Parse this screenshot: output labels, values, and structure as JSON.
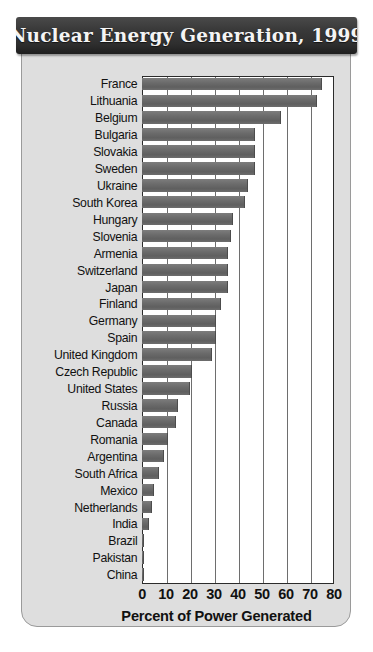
{
  "title": "Nuclear Energy Generation, 1999",
  "axis_label": "Percent of Power Generated",
  "colors": {
    "banner": "#2f2f2f",
    "banner_text": "#f4f4f4",
    "card_background": "#dedede",
    "plot_background": "#ffffff",
    "bar": "#6b6b6b",
    "gridline": "#6e6e6e",
    "axis": "#2b2b2b",
    "text": "#111111"
  },
  "chart_data": {
    "type": "bar",
    "orientation": "horizontal",
    "title": "Nuclear Energy Generation, 1999",
    "xlabel": "Percent of Power Generated",
    "ylabel": "",
    "xlim": [
      0,
      80
    ],
    "xticks": [
      0,
      10,
      20,
      30,
      40,
      50,
      60,
      70,
      80
    ],
    "grid": true,
    "legend": false,
    "unit": "percent",
    "categories": [
      "France",
      "Lithuania",
      "Belgium",
      "Bulgaria",
      "Slovakia",
      "Sweden",
      "Ukraine",
      "South Korea",
      "Hungary",
      "Slovenia",
      "Armenia",
      "Switzerland",
      "Japan",
      "Finland",
      "Germany",
      "Spain",
      "United Kingdom",
      "Czech Republic",
      "United States",
      "Russia",
      "Canada",
      "Romania",
      "Argentina",
      "South Africa",
      "Mexico",
      "Netherlands",
      "India",
      "Brazil",
      "Pakistan",
      "China"
    ],
    "values": [
      75,
      73,
      58,
      47,
      47,
      47,
      44,
      43,
      38,
      37,
      36,
      36,
      36,
      33,
      31,
      31,
      29,
      21,
      20,
      15,
      14,
      11,
      9,
      7,
      5,
      4,
      3,
      1,
      1,
      1
    ]
  }
}
